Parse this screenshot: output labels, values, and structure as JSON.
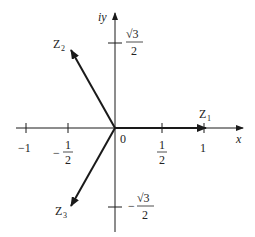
{
  "diagram": {
    "axes": {
      "x_label": "x",
      "y_label": "iy",
      "origin_label": "0"
    },
    "x_ticks": [
      {
        "value": -1,
        "label": "−1"
      },
      {
        "value": -0.5,
        "label_sign": "−",
        "label_num": "1",
        "label_den": "2"
      },
      {
        "value": 0.5,
        "label_num": "1",
        "label_den": "2"
      },
      {
        "value": 1,
        "label": "1"
      }
    ],
    "y_ticks": [
      {
        "value": 0.866,
        "label_num": "√3",
        "label_den": "2"
      },
      {
        "value": -0.866,
        "label_sign": "−",
        "label_num": "√3",
        "label_den": "2"
      }
    ],
    "vectors": [
      {
        "name": "Z1",
        "label_main": "Z",
        "label_sub": "1",
        "x": 1,
        "y": 0
      },
      {
        "name": "Z2",
        "label_main": "Z",
        "label_sub": "2",
        "x": -0.5,
        "y": 0.866
      },
      {
        "name": "Z3",
        "label_main": "Z",
        "label_sub": "3",
        "x": -0.5,
        "y": -0.866
      }
    ],
    "colors": {
      "line": "#1a1a1a",
      "text": "#222222",
      "background": "#ffffff"
    }
  }
}
